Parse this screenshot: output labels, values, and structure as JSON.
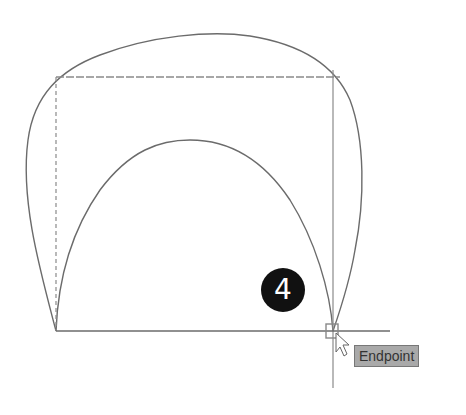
{
  "step_badge": {
    "number": "4"
  },
  "snap_tooltip": {
    "label": "Endpoint"
  },
  "colors": {
    "line": "#6b6b6b",
    "dashed": "#8a8a8a",
    "badge_bg": "#111111",
    "tooltip_bg": "#a9a9a9"
  },
  "cursor": {
    "type": "arrow-with-snap-marker",
    "x": 333,
    "y": 331
  }
}
